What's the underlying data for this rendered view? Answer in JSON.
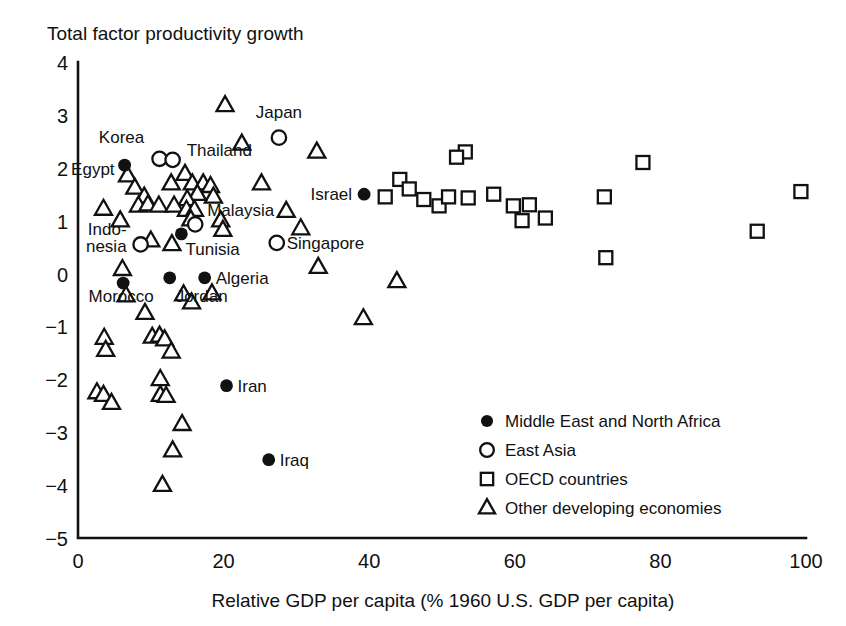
{
  "chart_data": {
    "type": "scatter",
    "title": "Total factor productivity growth",
    "ylabel": "Total factor productivity growth",
    "xlabel": "Relative GDP per capita (% 1960 U.S. GDP per capita)",
    "xlim": [
      0,
      100
    ],
    "ylim": [
      -5,
      4
    ],
    "xticks": [
      "0",
      "20",
      "40",
      "60",
      "80",
      "100"
    ],
    "xtick_values": [
      0,
      20,
      40,
      60,
      80,
      100
    ],
    "yticks": [
      "4",
      "3",
      "2",
      "1",
      "0",
      "−1",
      "−2",
      "−3",
      "−4",
      "−5"
    ],
    "ytick_values": [
      4,
      3,
      2,
      1,
      0,
      -1,
      -2,
      -3,
      -4,
      -5
    ],
    "grid": false,
    "legend_position": "bottom-right",
    "marker_color": "#111111",
    "background": "#ffffff",
    "legend": [
      {
        "marker": "filled-circle",
        "label": "Middle East and North Africa"
      },
      {
        "marker": "open-circle",
        "label": "East Asia"
      },
      {
        "marker": "open-square",
        "label": "OECD countries"
      },
      {
        "marker": "open-triangle",
        "label": "Other developing economies"
      }
    ],
    "series": [
      {
        "name": "Middle East and North Africa",
        "marker": "filled-circle",
        "points": [
          {
            "x": 6.4,
            "y": 2.05,
            "label": "Egypt"
          },
          {
            "x": 14.2,
            "y": 0.75,
            "label": ""
          },
          {
            "x": 6.2,
            "y": -0.18,
            "label": "Morocco"
          },
          {
            "x": 12.6,
            "y": -0.08,
            "label": ""
          },
          {
            "x": 17.4,
            "y": -0.08,
            "label": "Algeria"
          },
          {
            "x": 39.3,
            "y": 1.5,
            "label": "Israel"
          },
          {
            "x": 20.4,
            "y": -2.12,
            "label": "Iran"
          },
          {
            "x": 26.2,
            "y": -3.52,
            "label": "Iraq"
          }
        ]
      },
      {
        "name": "East Asia",
        "marker": "open-circle",
        "points": [
          {
            "x": 11.2,
            "y": 2.17,
            "label": "Korea"
          },
          {
            "x": 13.0,
            "y": 2.15,
            "label": "Thailand"
          },
          {
            "x": 27.6,
            "y": 2.57,
            "label": "Japan"
          },
          {
            "x": 16.1,
            "y": 0.93,
            "label": "Malaysia"
          },
          {
            "x": 27.3,
            "y": 0.58,
            "label": "Singapore"
          },
          {
            "x": 8.6,
            "y": 0.55,
            "label": "Indonesia"
          }
        ]
      },
      {
        "name": "OECD countries",
        "marker": "open-square",
        "points": [
          {
            "x": 53.2,
            "y": 2.3,
            "y_note": "pair upper"
          },
          {
            "x": 52.0,
            "y": 2.2
          },
          {
            "x": 44.2,
            "y": 1.78
          },
          {
            "x": 45.5,
            "y": 1.6
          },
          {
            "x": 47.5,
            "y": 1.4
          },
          {
            "x": 42.2,
            "y": 1.45
          },
          {
            "x": 49.6,
            "y": 1.28
          },
          {
            "x": 50.9,
            "y": 1.45
          },
          {
            "x": 53.6,
            "y": 1.43
          },
          {
            "x": 57.1,
            "y": 1.5
          },
          {
            "x": 59.8,
            "y": 1.28
          },
          {
            "x": 62.0,
            "y": 1.3
          },
          {
            "x": 61.0,
            "y": 1.0
          },
          {
            "x": 64.2,
            "y": 1.05
          },
          {
            "x": 72.3,
            "y": 1.45
          },
          {
            "x": 72.5,
            "y": 0.3
          },
          {
            "x": 77.6,
            "y": 2.1
          },
          {
            "x": 93.3,
            "y": 0.8
          },
          {
            "x": 99.3,
            "y": 1.55
          }
        ]
      },
      {
        "name": "Other developing economies",
        "marker": "open-triangle",
        "points": [
          {
            "x": 20.2,
            "y": 3.18
          },
          {
            "x": 22.5,
            "y": 2.45
          },
          {
            "x": 32.8,
            "y": 2.3
          },
          {
            "x": 6.8,
            "y": 1.85
          },
          {
            "x": 7.8,
            "y": 1.62
          },
          {
            "x": 9.1,
            "y": 1.45
          },
          {
            "x": 12.8,
            "y": 1.7
          },
          {
            "x": 14.7,
            "y": 1.88
          },
          {
            "x": 15.7,
            "y": 1.7
          },
          {
            "x": 17.2,
            "y": 1.7
          },
          {
            "x": 18.2,
            "y": 1.65
          },
          {
            "x": 18.6,
            "y": 1.45
          },
          {
            "x": 16.4,
            "y": 1.5
          },
          {
            "x": 15.0,
            "y": 1.4
          },
          {
            "x": 25.2,
            "y": 1.7
          },
          {
            "x": 3.5,
            "y": 1.22
          },
          {
            "x": 8.3,
            "y": 1.28
          },
          {
            "x": 9.6,
            "y": 1.3
          },
          {
            "x": 11.1,
            "y": 1.28
          },
          {
            "x": 13.2,
            "y": 1.28
          },
          {
            "x": 14.9,
            "y": 1.2
          },
          {
            "x": 16.0,
            "y": 1.2
          },
          {
            "x": 28.6,
            "y": 1.18
          },
          {
            "x": 5.8,
            "y": 1.0
          },
          {
            "x": 15.5,
            "y": 1.02
          },
          {
            "x": 19.6,
            "y": 1.0
          },
          {
            "x": 19.9,
            "y": 0.82
          },
          {
            "x": 30.6,
            "y": 0.85
          },
          {
            "x": 10.0,
            "y": 0.62
          },
          {
            "x": 12.9,
            "y": 0.55
          },
          {
            "x": 33.0,
            "y": 0.12
          },
          {
            "x": 6.1,
            "y": 0.08
          },
          {
            "x": 14.5,
            "y": -0.4
          },
          {
            "x": 15.6,
            "y": -0.55
          },
          {
            "x": 18.4,
            "y": -0.38
          },
          {
            "x": 6.6,
            "y": -0.42
          },
          {
            "x": 43.8,
            "y": -0.15
          },
          {
            "x": 9.2,
            "y": -0.75
          },
          {
            "x": 39.2,
            "y": -0.85
          },
          {
            "x": 3.6,
            "y": -1.22
          },
          {
            "x": 3.8,
            "y": -1.45
          },
          {
            "x": 10.2,
            "y": -1.2
          },
          {
            "x": 11.2,
            "y": -1.18
          },
          {
            "x": 11.9,
            "y": -1.25
          },
          {
            "x": 12.8,
            "y": -1.48
          },
          {
            "x": 11.3,
            "y": -2.0
          },
          {
            "x": 2.6,
            "y": -2.25
          },
          {
            "x": 3.5,
            "y": -2.3
          },
          {
            "x": 4.6,
            "y": -2.45
          },
          {
            "x": 11.3,
            "y": -2.3
          },
          {
            "x": 12.1,
            "y": -2.32
          },
          {
            "x": 14.3,
            "y": -2.85
          },
          {
            "x": 13.0,
            "y": -3.35
          },
          {
            "x": 11.6,
            "y": -4.0
          }
        ]
      }
    ]
  }
}
